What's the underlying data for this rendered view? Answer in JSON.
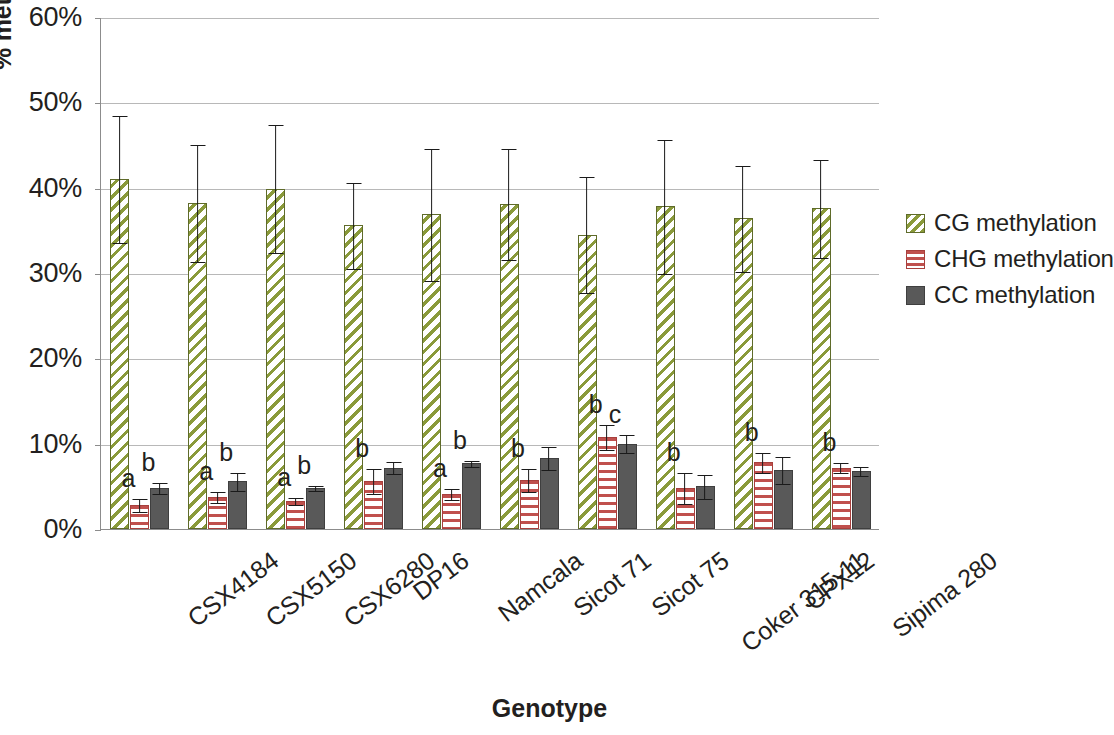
{
  "chart_data": {
    "type": "bar",
    "title": "",
    "xlabel": "Genotype",
    "ylabel": "% methylation (total CCGG)",
    "ylim": [
      0,
      60
    ],
    "ytick_labels": [
      "0%",
      "10%",
      "20%",
      "30%",
      "40%",
      "50%",
      "60%"
    ],
    "ytick_values": [
      0,
      10,
      20,
      30,
      40,
      50,
      60
    ],
    "grid": true,
    "legend_position": "right",
    "categories": [
      "CSX4184",
      "CSX5150",
      "CSX6280",
      "DP16",
      "Namcala",
      "Sicot 71",
      "Sicot 75",
      "Coker 315-11",
      "CPX12",
      "Sipima 280"
    ],
    "series": [
      {
        "name": "CG methylation",
        "key": "cg",
        "color": "#8a9a3a",
        "pattern": "diagonal-hatch",
        "values": [
          41.0,
          38.2,
          39.9,
          35.6,
          36.9,
          38.1,
          34.5,
          37.8,
          36.4,
          37.6
        ],
        "err_upper": [
          7.5,
          6.9,
          7.6,
          5.1,
          7.8,
          6.6,
          6.9,
          7.9,
          6.3,
          5.8
        ],
        "err_lower": [
          7.5,
          6.9,
          7.6,
          5.1,
          7.8,
          6.6,
          6.9,
          7.9,
          6.3,
          5.8
        ],
        "sig_letters": [
          "",
          "",
          "",
          "",
          "",
          "",
          "",
          "",
          "",
          ""
        ]
      },
      {
        "name": "CHG methylation",
        "key": "chg",
        "color": "#c0504d",
        "pattern": "horizontal-stripe",
        "values": [
          2.8,
          3.7,
          3.3,
          5.6,
          4.1,
          5.7,
          10.8,
          4.8,
          7.8,
          7.2
        ],
        "err_upper": [
          0.8,
          0.7,
          0.5,
          1.5,
          0.7,
          1.4,
          1.5,
          1.9,
          1.2,
          0.6
        ],
        "err_lower": [
          0.8,
          0.7,
          0.5,
          1.5,
          0.7,
          1.4,
          1.5,
          1.9,
          1.2,
          0.6
        ],
        "sig_letters": [
          "a",
          "a",
          "a",
          "b",
          "a",
          "b",
          "b",
          "b",
          "b",
          "b"
        ]
      },
      {
        "name": "CC methylation",
        "key": "cc",
        "color": "#595959",
        "pattern": "solid",
        "values": [
          4.8,
          5.6,
          4.8,
          7.2,
          7.7,
          8.3,
          10.0,
          5.0,
          6.9,
          6.8
        ],
        "err_upper": [
          0.7,
          1.1,
          0.3,
          0.8,
          0.4,
          1.4,
          1.1,
          1.5,
          1.6,
          0.6
        ],
        "err_lower": [
          0.7,
          1.1,
          0.3,
          0.8,
          0.4,
          1.4,
          1.1,
          1.5,
          1.6,
          0.6
        ],
        "sig_letters": [
          "b",
          "b",
          "b",
          "",
          "b",
          "",
          "c",
          "",
          "",
          ""
        ]
      }
    ]
  },
  "legend": {
    "items": [
      {
        "label": "CG methylation",
        "key": "cg"
      },
      {
        "label": "CHG methylation",
        "key": "chg"
      },
      {
        "label": "CC methylation",
        "key": "cc"
      }
    ]
  }
}
